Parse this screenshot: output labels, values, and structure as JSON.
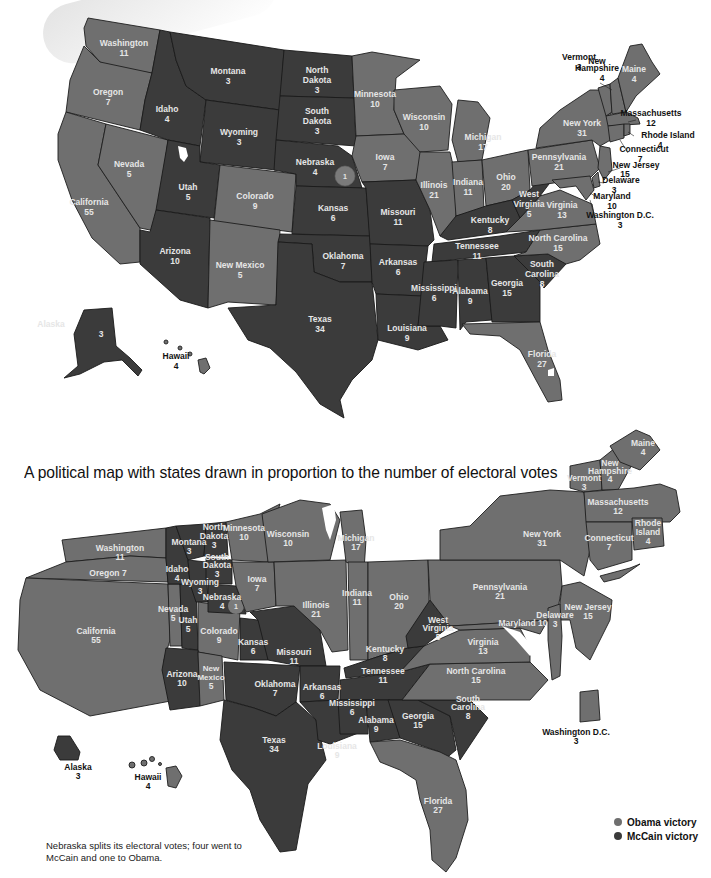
{
  "caption": "A political map with states drawn in proportion to the number of electoral votes",
  "footnote": "Nebraska splits its electoral votes; four went to McCain and one to Obama.",
  "legend": {
    "obama": {
      "label": "Obama victory",
      "color": "#6f6f6f"
    },
    "mccain": {
      "label": "McCain victory",
      "color": "#3b3b3b"
    }
  },
  "nebraska_split_marker": "1",
  "states": {
    "washington": {
      "name": "Washington",
      "votes": "11",
      "winner": "obama"
    },
    "oregon": {
      "name": "Oregon",
      "votes": "7",
      "winner": "obama",
      "cartogram_label": "Oregon 7"
    },
    "california": {
      "name": "California",
      "votes": "55",
      "winner": "obama"
    },
    "nevada": {
      "name": "Nevada",
      "votes": "5",
      "winner": "obama"
    },
    "idaho": {
      "name": "Idaho",
      "votes": "4",
      "winner": "mccain"
    },
    "montana": {
      "name": "Montana",
      "votes": "3",
      "winner": "mccain"
    },
    "wyoming": {
      "name": "Wyoming",
      "votes": "3",
      "winner": "mccain"
    },
    "utah": {
      "name": "Utah",
      "votes": "5",
      "winner": "mccain"
    },
    "colorado": {
      "name": "Colorado",
      "votes": "9",
      "winner": "obama"
    },
    "arizona": {
      "name": "Arizona",
      "votes": "10",
      "winner": "mccain"
    },
    "new_mexico": {
      "name": "New Mexico",
      "votes": "5",
      "winner": "obama"
    },
    "north_dakota": {
      "name": "North Dakota",
      "line1": "North",
      "line2": "Dakota",
      "votes": "3",
      "winner": "mccain"
    },
    "south_dakota": {
      "name": "South Dakota",
      "line1": "South",
      "line2": "Dakota",
      "votes": "3",
      "winner": "mccain"
    },
    "nebraska": {
      "name": "Nebraska",
      "votes": "4",
      "winner": "mccain"
    },
    "kansas": {
      "name": "Kansas",
      "votes": "6",
      "winner": "mccain"
    },
    "oklahoma": {
      "name": "Oklahoma",
      "votes": "7",
      "winner": "mccain"
    },
    "texas": {
      "name": "Texas",
      "votes": "34",
      "winner": "mccain"
    },
    "minnesota": {
      "name": "Minnesota",
      "votes": "10",
      "winner": "obama"
    },
    "iowa": {
      "name": "Iowa",
      "votes": "7",
      "winner": "obama"
    },
    "missouri": {
      "name": "Missouri",
      "votes": "11",
      "winner": "mccain"
    },
    "arkansas": {
      "name": "Arkansas",
      "votes": "6",
      "winner": "mccain"
    },
    "louisiana": {
      "name": "Louisiana",
      "votes": "9",
      "winner": "mccain"
    },
    "wisconsin": {
      "name": "Wisconsin",
      "votes": "10",
      "winner": "obama"
    },
    "illinois": {
      "name": "Illinois",
      "votes": "21",
      "winner": "obama"
    },
    "michigan": {
      "name": "Michigan",
      "votes": "17",
      "winner": "obama"
    },
    "indiana": {
      "name": "Indiana",
      "votes": "11",
      "winner": "obama"
    },
    "ohio": {
      "name": "Ohio",
      "votes": "20",
      "winner": "obama"
    },
    "kentucky": {
      "name": "Kentucky",
      "votes": "8",
      "winner": "mccain"
    },
    "tennessee": {
      "name": "Tennessee",
      "votes": "11",
      "winner": "mccain"
    },
    "mississippi": {
      "name": "Mississippi",
      "votes": "6",
      "winner": "mccain"
    },
    "alabama": {
      "name": "Alabama",
      "votes": "9",
      "winner": "mccain"
    },
    "georgia": {
      "name": "Georgia",
      "votes": "15",
      "winner": "mccain"
    },
    "florida": {
      "name": "Florida",
      "votes": "27",
      "winner": "obama"
    },
    "south_carolina": {
      "name": "South Carolina",
      "line1": "South",
      "line2": "Carolina",
      "votes": "8",
      "winner": "mccain"
    },
    "north_carolina": {
      "name": "North Carolina",
      "votes": "15",
      "winner": "obama"
    },
    "virginia": {
      "name": "Virginia",
      "votes": "13",
      "winner": "obama"
    },
    "west_virginia": {
      "name": "West Virginia",
      "line1": "West",
      "line2": "Virginia",
      "votes": "5",
      "winner": "mccain"
    },
    "pennsylvania": {
      "name": "Pennsylvania",
      "votes": "21",
      "winner": "obama"
    },
    "new_york": {
      "name": "New York",
      "votes": "31",
      "winner": "obama"
    },
    "vermont": {
      "name": "Vermont",
      "votes": "3",
      "winner": "obama"
    },
    "new_hampshire": {
      "name": "New Hampshire",
      "line1": "New",
      "line2": "Hampshire",
      "votes": "4",
      "winner": "obama"
    },
    "maine": {
      "name": "Maine",
      "votes": "4",
      "winner": "obama"
    },
    "massachusetts": {
      "name": "Massachusetts",
      "votes": "12",
      "winner": "obama"
    },
    "rhode_island": {
      "name": "Rhode Island",
      "line1": "Rhode",
      "line2": "Island",
      "votes": "4",
      "winner": "obama"
    },
    "connecticut": {
      "name": "Connecticut",
      "votes": "7",
      "winner": "obama"
    },
    "new_jersey": {
      "name": "New Jersey",
      "votes": "15",
      "winner": "obama"
    },
    "delaware": {
      "name": "Delaware",
      "votes": "3",
      "winner": "obama"
    },
    "maryland": {
      "name": "Maryland",
      "votes": "10",
      "winner": "obama",
      "cartogram_label": "Maryland 10"
    },
    "dc": {
      "name": "Washington D.C.",
      "votes": "3",
      "winner": "obama"
    },
    "alaska": {
      "name": "Alaska",
      "votes": "3",
      "winner": "mccain"
    },
    "hawaii": {
      "name": "Hawaii",
      "votes": "4",
      "winner": "obama"
    }
  }
}
